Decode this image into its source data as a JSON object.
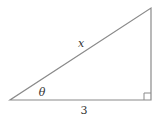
{
  "diagram": {
    "type": "right-triangle",
    "stroke_color": "#8a8a8a",
    "text_color": "#333333",
    "vertices": {
      "left": [
        10,
        100
      ],
      "right": [
        151,
        100
      ],
      "top": [
        151,
        8
      ]
    },
    "right_angle_marker_size": 7,
    "labels": {
      "hypotenuse": "x",
      "angle": "θ",
      "base": "3"
    }
  }
}
